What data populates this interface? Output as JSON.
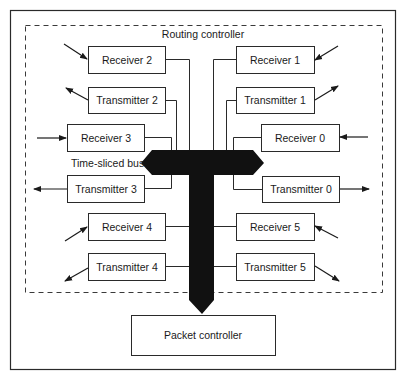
{
  "diagram": {
    "routing_controller_label": "Routing controller",
    "bus_label": "Time-sliced bus",
    "packet_controller_label": "Packet controller",
    "left_units": [
      {
        "label": "Receiver 2",
        "type": "receiver"
      },
      {
        "label": "Transmitter 2",
        "type": "transmitter"
      },
      {
        "label": "Receiver 3",
        "type": "receiver"
      },
      {
        "label": "Transmitter 3",
        "type": "transmitter"
      },
      {
        "label": "Receiver 4",
        "type": "receiver"
      },
      {
        "label": "Transmitter 4",
        "type": "transmitter"
      }
    ],
    "right_units": [
      {
        "label": "Receiver 1",
        "type": "receiver"
      },
      {
        "label": "Transmitter 1",
        "type": "transmitter"
      },
      {
        "label": "Receiver 0",
        "type": "receiver"
      },
      {
        "label": "Transmitter 0",
        "type": "transmitter"
      },
      {
        "label": "Receiver 5",
        "type": "receiver"
      },
      {
        "label": "Transmitter 5",
        "type": "transmitter"
      }
    ],
    "colors": {
      "bus": "#111111",
      "stroke": "#2a2a2a",
      "background": "#ffffff"
    }
  }
}
